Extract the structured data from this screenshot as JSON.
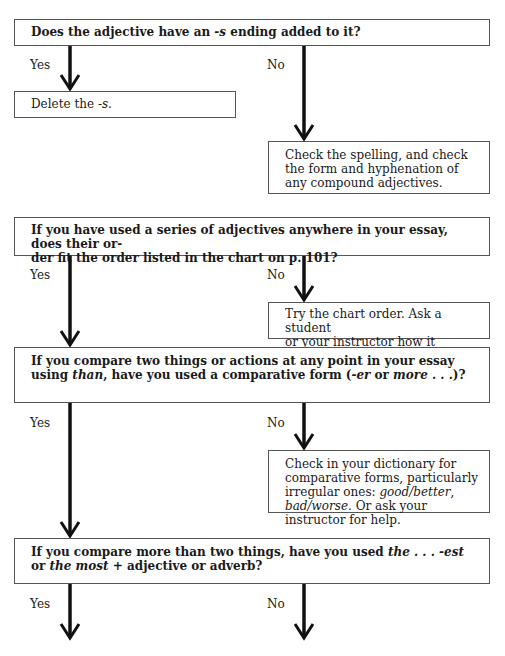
{
  "flowchart": {
    "steps": [
      {
        "question": {
          "pre": "Does the adjective have an ",
          "em1": "-s",
          "post": " ending added to it?"
        },
        "yes_label": "Yes",
        "no_label": "No",
        "yes_action": {
          "pre": "Delete the ",
          "em": "-s."
        },
        "no_action": "Check the spelling, and check the form and hyphenation of any compound adjectives."
      },
      {
        "question": {
          "line1": "If you have used a series of adjectives anywhere in your essay, does their or-",
          "line2": "der fit the order listed in the chart on p. 101?"
        },
        "yes_label": "Yes",
        "no_label": "No",
        "no_action": {
          "line1": "Try the chart order. Ask a student",
          "line2": "or your instructor how it sounds."
        }
      },
      {
        "question": {
          "pre": "If you compare two things or actions at any point in your essay using ",
          "em1": "than",
          "mid1": ", have you used a comparative form (",
          "em2": "-er",
          "mid2": " or ",
          "em3": "more . . .",
          "post": ")?"
        },
        "yes_label": "Yes",
        "no_label": "No",
        "no_action": {
          "pre": "Check in your dictionary for comparative forms, particularly irregular ones: ",
          "em1": "good/better",
          "mid": ", ",
          "em2": "bad/worse.",
          "post": " Or ask your instructor for help."
        }
      },
      {
        "question": {
          "pre": "If you compare more than two things, have you used ",
          "em1": "the . . . -est",
          "mid": " or ",
          "em2": "the most",
          "post": " + adjective or adverb?"
        },
        "yes_label": "Yes",
        "no_label": "No"
      }
    ]
  },
  "colors": {
    "border": "#555555",
    "arrow": "#111111",
    "text": "#1a1a1a"
  }
}
